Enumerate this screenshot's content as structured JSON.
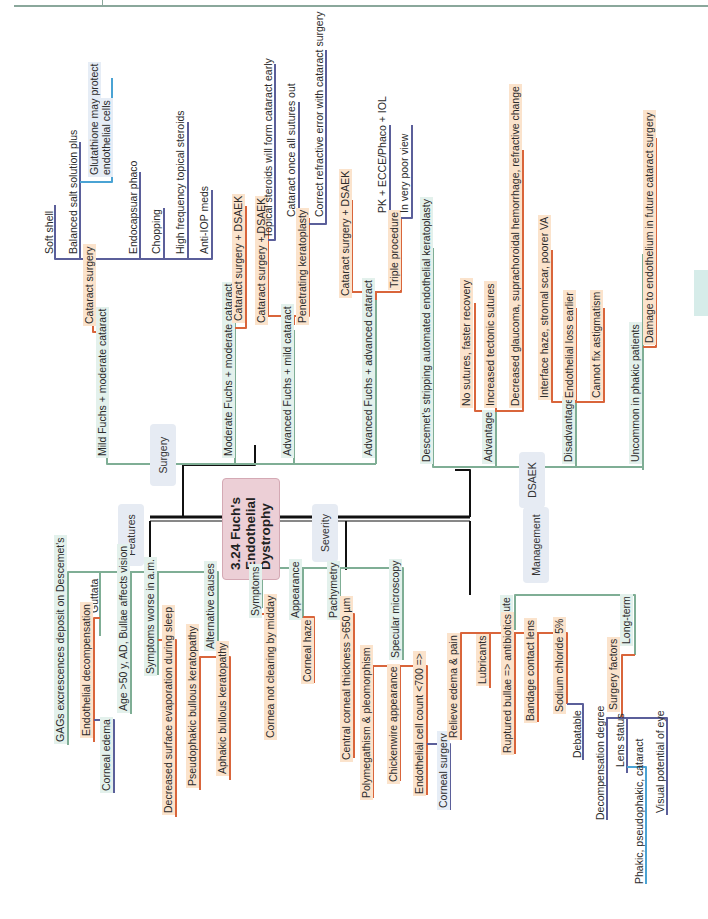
{
  "page": {
    "side_tab_color": "#d6ece9",
    "header_rule_color": "#8aa79b"
  },
  "center": {
    "line1": "3.24 Fuch's",
    "line2": "Endothelial",
    "line3": "Dystrophy"
  },
  "categories": {
    "surgery": "Surgery",
    "features": "Features",
    "severity": "Severity",
    "management": "Management",
    "dsaek": "DSAEK"
  },
  "colors": {
    "green": "#7fae95",
    "orange": "#d9653b",
    "navy": "#5b5f9a",
    "blue": "#4aa3d4",
    "black": "#111111",
    "center_fill": "#eccfd6"
  },
  "surgery": {
    "mild": {
      "label": "Mild Fuchs + moderate cataract",
      "cataract_surgery": "Cataract surgery",
      "items": [
        "Soft shell",
        "Balanced salt solution plus",
        "Glutathione may protect",
        "endothelial cells",
        "Endocapsuar phaco",
        "Chopping",
        "High frequency topical steroids",
        "Anti-IOP meds"
      ]
    },
    "moderate": {
      "label": "Moderate Fuchs + moderate cataract",
      "option": "Cataract surgery + DSAEK"
    },
    "advanced_mild": {
      "label": "Advanced Fuchs + mild cataract",
      "option1": "Cataract surgery + DSAEK",
      "option2": "Penetrating keratoplasty",
      "sub": [
        "Topical steroids will form cataract early",
        "Cataract once all sutures out",
        "Correct refractive error with cataract surgery"
      ]
    },
    "advanced_adv": {
      "label": "Advanced Fuchs + advanced cataract",
      "option1": "Cataract surgery + DSAEK",
      "option2": "Triple procedure",
      "sub": [
        "PK + ECCE/Phaco + IOL",
        "In very poor view"
      ]
    }
  },
  "dsaek": {
    "full_name": "Descemet's stripping automated endothelial keratoplasty",
    "advantage": "Advantage",
    "advantages": [
      "No sutures, faster recovery",
      "Increased tectonic sutures",
      "Decreased glaucoma, suprachoroidal hemorrhage, refractive change"
    ],
    "disadvantage": "Disadvantage",
    "disadvantages": [
      "Interface haze, stromal scar, poorer VA",
      "Endothelial loss earlier",
      "Cannot fix astigmatism"
    ],
    "phakic": "Uncommon in phakic patients",
    "phakic_note": "Damage to endothelium in future cataract surgery"
  },
  "features": {
    "gags": "GAGs excrescences deposit on Descemet's",
    "guttata": "Guttata",
    "endo_decomp": "Endothelial decompensation",
    "corneal_edema": "Corneal edema",
    "age": "Age >50 y, AD, Bullae affects vision",
    "symptoms_am": "Symptoms worse in a.m.",
    "evap": "Decreased surface evaporation during sleep",
    "alt_causes": "Alternative causes",
    "alt": [
      "Pseudophakic bullous keratopathy",
      "Aphakic bullous keratopathy"
    ]
  },
  "severity": {
    "symptoms": "Symptoms",
    "symptoms_item": "Cornea not clearing by midday",
    "appearance": "Appearance",
    "appearance_item": "Corneal haze",
    "pachymetry": "Pachymetry",
    "pachymetry_item": "Central corneal thickness >650 µm",
    "specular": "Specular microscopy",
    "specular_items": [
      "Polymegathism & pleomorphism",
      "Chickenwire appearance",
      "Endothelial cell count <700 =>"
    ],
    "corneal_surgery": "Corneal surgery"
  },
  "management": {
    "acute": "Acute",
    "acute_items": [
      "Relieve edema & pain",
      "Lubricants",
      "Ruptured bullae => antibiotics",
      "Bandage contact lens",
      "Sodium chloride 5%"
    ],
    "debatable": "Debatable",
    "long_term": "Long-term",
    "surgery_factors": "Surgery factors",
    "factors": [
      "Decompensation degree",
      "Lens status",
      "Visual potential of eye"
    ],
    "lens_status_detail": "Phakic, pseudophakic, cataract"
  }
}
